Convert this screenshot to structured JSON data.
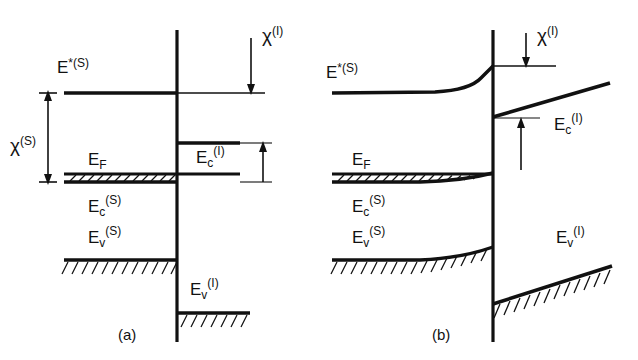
{
  "figure": {
    "type": "energy-band-diagram",
    "background": "#ffffff",
    "ink": "#111111",
    "width": 638,
    "height": 360
  },
  "panels": [
    {
      "id": "a",
      "caption": "(a)",
      "caption_x": 118,
      "caption_y": 340,
      "interface_x": 177,
      "interface_y_top": 30,
      "interface_y_bottom": 342,
      "labels": {
        "e_star_s": {
          "base": "E",
          "sup": "*(S)",
          "x": 57,
          "y": 73
        },
        "chi_s": {
          "base": "χ",
          "sup": "(S)",
          "x": 10,
          "y": 152
        },
        "chi_i": {
          "base": "χ",
          "sup": "(I)",
          "x": 252,
          "y": 42
        },
        "e_f": {
          "base": "E",
          "sub": "F",
          "x": 88,
          "y": 165
        },
        "e_c_i": {
          "base": "E",
          "sub": "c",
          "sup": "(I)",
          "x": 196,
          "y": 160
        },
        "e_c_s": {
          "base": "E",
          "sub": "c",
          "sup": "(S)",
          "x": 88,
          "y": 212
        },
        "e_v_s": {
          "base": "E",
          "sub": "v",
          "sup": "(S)",
          "x": 88,
          "y": 243
        },
        "e_v_i": {
          "base": "E",
          "sub": "v",
          "sup": "(I)",
          "x": 190,
          "y": 292
        }
      },
      "levels": {
        "e_star_s_y": 93,
        "e_c_i_y": 143,
        "e_f_y": 175,
        "e_c_s_y": 182,
        "e_v_s_y": 260,
        "e_v_i_y": 313
      }
    },
    {
      "id": "b",
      "caption": "(b)",
      "caption_x": 432,
      "caption_y": 340,
      "interface_x": 493,
      "interface_y_top": 30,
      "interface_y_bottom": 342,
      "labels": {
        "e_star_s": {
          "base": "E",
          "sup": "*(S)",
          "x": 326,
          "y": 78
        },
        "chi_i": {
          "base": "χ",
          "sup": "(I)",
          "x": 533,
          "y": 42
        },
        "e_f": {
          "base": "E",
          "sub": "F",
          "x": 352,
          "y": 165
        },
        "e_c_i": {
          "base": "E",
          "sub": "c",
          "sup": "(I)",
          "x": 554,
          "y": 127
        },
        "e_c_s": {
          "base": "E",
          "sub": "c",
          "sup": "(S)",
          "x": 352,
          "y": 212
        },
        "e_v_s": {
          "base": "E",
          "sub": "v",
          "sup": "(S)",
          "x": 352,
          "y": 243
        },
        "e_v_i": {
          "base": "E",
          "sub": "v",
          "sup": "(I)",
          "x": 556,
          "y": 243
        }
      },
      "levels": {
        "e_star_s_flat_y": 93,
        "e_star_s_interface_y": 67,
        "e_c_i_interface_y": 117,
        "e_c_i_right_y": 83,
        "e_f_y": 175,
        "e_c_s_flat_y": 182,
        "e_c_s_interface_y": 172,
        "e_v_s_flat_y": 260,
        "e_v_s_interface_y": 248,
        "e_v_i_interface_y": 304,
        "e_v_i_right_y": 266
      }
    }
  ]
}
